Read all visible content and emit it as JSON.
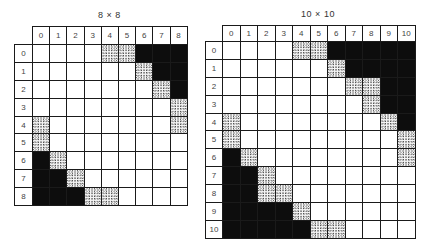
{
  "grids": [
    {
      "title": "8 × 8",
      "col_labels": [
        "0",
        "1",
        "2",
        "3",
        "4",
        "5",
        "6",
        "7",
        "8"
      ],
      "row_labels": [
        "0",
        "1",
        "2",
        "3",
        "4",
        "5",
        "6",
        "7",
        "8"
      ],
      "cells": [
        "....DDBBB",
        "......DBB",
        ".......DB",
        "........D",
        "D.......D",
        "D........",
        "BD.......",
        "BBD......",
        "BBBDD...."
      ]
    },
    {
      "title": "10 × 10",
      "col_labels": [
        "0",
        "1",
        "2",
        "3",
        "4",
        "5",
        "6",
        "7",
        "8",
        "9",
        "10"
      ],
      "row_labels": [
        "0",
        "1",
        "2",
        "3",
        "4",
        "5",
        "6",
        "7",
        "8",
        "9",
        "10"
      ],
      "cells": [
        "....DDBBBBB",
        "......DBBBB",
        ".......DDBB",
        "........DBB",
        "D........DB",
        "D.........D",
        "BD........D",
        "BBD........",
        "BBDD.......",
        "BBBBD......",
        "BBBBBDD...."
      ]
    }
  ],
  "legend": {
    "B": "black-filled cell",
    "D": "stippled cell",
    ".": "empty cell"
  }
}
